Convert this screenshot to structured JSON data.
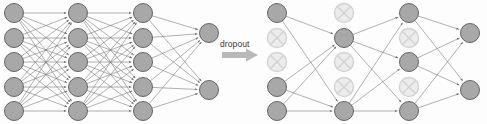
{
  "figure": {
    "background_color": "#fdfdfd",
    "width": 487,
    "height": 124
  },
  "annotation": {
    "label": "dropout",
    "label_x": 220,
    "label_y": 40,
    "arrow_color": "#b9b9b9",
    "arrow_x": 222,
    "arrow_y": 55,
    "arrow_length": 36
  },
  "style": {
    "node_active_fill": "#a8a8a8",
    "node_active_stroke": "#585858",
    "node_dropped_fill": "#ececec",
    "node_dropped_stroke": "#d2d2d2",
    "node_cross_color": "#d2d2d2",
    "edge_color": "#6f6f6f",
    "edge_width": 0.55,
    "node_radius": 9.5
  },
  "networks": [
    {
      "name": "standard-neural-net",
      "caption": "",
      "layers": [
        {
          "name": "input-layer",
          "x": 14,
          "nodes": [
            {
              "y": 13,
              "state": "active"
            },
            {
              "y": 38,
              "state": "active"
            },
            {
              "y": 62,
              "state": "active"
            },
            {
              "y": 87,
              "state": "active"
            },
            {
              "y": 111,
              "state": "active"
            }
          ]
        },
        {
          "name": "hidden-layer-1",
          "x": 78,
          "nodes": [
            {
              "y": 13,
              "state": "active"
            },
            {
              "y": 38,
              "state": "active"
            },
            {
              "y": 62,
              "state": "active"
            },
            {
              "y": 87,
              "state": "active"
            },
            {
              "y": 111,
              "state": "active"
            }
          ]
        },
        {
          "name": "hidden-layer-2",
          "x": 143,
          "nodes": [
            {
              "y": 13,
              "state": "active"
            },
            {
              "y": 38,
              "state": "active"
            },
            {
              "y": 62,
              "state": "active"
            },
            {
              "y": 87,
              "state": "active"
            },
            {
              "y": 111,
              "state": "active"
            }
          ]
        },
        {
          "name": "output-layer",
          "x": 209,
          "nodes": [
            {
              "y": 33,
              "state": "active"
            },
            {
              "y": 90,
              "state": "active"
            }
          ]
        }
      ]
    },
    {
      "name": "dropout-neural-net",
      "caption": "",
      "layers": [
        {
          "name": "input-layer",
          "x": 277,
          "nodes": [
            {
              "y": 13,
              "state": "active"
            },
            {
              "y": 38,
              "state": "dropped"
            },
            {
              "y": 62,
              "state": "dropped"
            },
            {
              "y": 87,
              "state": "active"
            },
            {
              "y": 111,
              "state": "active"
            }
          ]
        },
        {
          "name": "hidden-layer-1",
          "x": 344,
          "nodes": [
            {
              "y": 13,
              "state": "dropped"
            },
            {
              "y": 38,
              "state": "active"
            },
            {
              "y": 62,
              "state": "dropped"
            },
            {
              "y": 87,
              "state": "dropped"
            },
            {
              "y": 111,
              "state": "active"
            }
          ]
        },
        {
          "name": "hidden-layer-2",
          "x": 409,
          "nodes": [
            {
              "y": 13,
              "state": "active"
            },
            {
              "y": 38,
              "state": "dropped"
            },
            {
              "y": 62,
              "state": "active"
            },
            {
              "y": 87,
              "state": "dropped"
            },
            {
              "y": 111,
              "state": "active"
            }
          ]
        },
        {
          "name": "output-layer",
          "x": 470,
          "nodes": [
            {
              "y": 33,
              "state": "active"
            },
            {
              "y": 90,
              "state": "active"
            }
          ]
        }
      ]
    }
  ]
}
